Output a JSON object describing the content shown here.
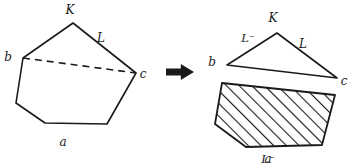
{
  "figure": {
    "background_color": "#ffffff",
    "stroke_color": "#1a1a1a",
    "hatch_color": "#1a1a1a",
    "left_shape": {
      "name": "pentagon",
      "vertices": [
        {
          "id": "b",
          "x": 73,
          "y": 23
        },
        {
          "id": "a",
          "x": 136,
          "y": 73
        },
        {
          "id": "d",
          "x": 107,
          "y": 124
        },
        {
          "id": "e",
          "x": 45,
          "y": 123
        },
        {
          "id": "f",
          "x": 16,
          "y": 103
        },
        {
          "id": "c",
          "x": 23,
          "y": 58
        }
      ],
      "dashed_chord": {
        "from": "c",
        "to": "a"
      }
    },
    "right_triangle": {
      "name": "triangle",
      "vertices": [
        {
          "id": "b",
          "x": 277,
          "y": 33
        },
        {
          "id": "a",
          "x": 337,
          "y": 78
        },
        {
          "id": "c",
          "x": 227,
          "y": 65
        }
      ]
    },
    "right_hatched": {
      "name": "hatched-quadrilateral",
      "vertices": [
        {
          "id": "c2",
          "x": 222,
          "y": 83
        },
        {
          "id": "a2",
          "x": 335,
          "y": 95
        },
        {
          "id": "d2",
          "x": 322,
          "y": 145
        },
        {
          "id": "e2",
          "x": 246,
          "y": 147
        },
        {
          "id": "f2",
          "x": 215,
          "y": 124
        }
      ]
    },
    "arrow": {
      "name": "right-arrow",
      "x": 166,
      "y": 72,
      "width": 28
    },
    "labels": [
      {
        "key": "L_left",
        "text": "L",
        "x": 45,
        "y": 37
      },
      {
        "key": "K_left",
        "text": "K",
        "x": 101,
        "y": 42
      },
      {
        "key": "b_left",
        "text": "b",
        "x": 70,
        "y": 14
      },
      {
        "key": "c_left",
        "text": "c",
        "x": 8,
        "y": 61
      },
      {
        "key": "a_left",
        "text": "a",
        "x": 143,
        "y": 78
      },
      {
        "key": "Lminus_left",
        "text": "L⁻",
        "x": 63,
        "y": 146
      },
      {
        "key": "L_right",
        "text": "L",
        "x": 248,
        "y": 42
      },
      {
        "key": "K_right",
        "text": "K",
        "x": 303,
        "y": 48
      },
      {
        "key": "b_right",
        "text": "b",
        "x": 273,
        "y": 22
      },
      {
        "key": "c_right",
        "text": "c",
        "x": 212,
        "y": 66
      },
      {
        "key": "a_right",
        "text": "a",
        "x": 344,
        "y": 85
      },
      {
        "key": "Lminus_right",
        "text": "L⁻",
        "x": 268,
        "y": 163
      }
    ]
  }
}
